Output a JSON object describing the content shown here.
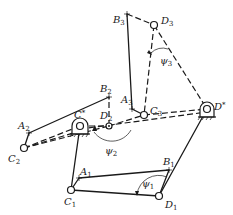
{
  "diagram": {
    "fixed_pivots": [
      {
        "id": "C*",
        "label": "C",
        "sup": "*"
      },
      {
        "id": "D*",
        "label": "D",
        "sup": "*"
      }
    ],
    "points": {
      "A1": {
        "label": "A",
        "sub": "1"
      },
      "B1": {
        "label": "B",
        "sub": "1"
      },
      "C1": {
        "label": "C",
        "sub": "1"
      },
      "D1": {
        "label": "D",
        "sub": "1"
      },
      "A2": {
        "label": "A",
        "sub": "2"
      },
      "B2": {
        "label": "B",
        "sub": "2"
      },
      "C2": {
        "label": "C",
        "sub": "2"
      },
      "D2": {
        "label": "D",
        "sub": "2"
      },
      "A3": {
        "label": "A",
        "sub": "3"
      },
      "B3": {
        "label": "B",
        "sub": "3"
      },
      "C3": {
        "label": "C",
        "sub": "3"
      },
      "D3": {
        "label": "D",
        "sub": "3"
      }
    },
    "angles": [
      {
        "id": "psi1",
        "label": "ψ",
        "sub": "1"
      },
      {
        "id": "psi2",
        "label": "ψ",
        "sub": "2"
      },
      {
        "id": "psi3",
        "label": "ψ",
        "sub": "3"
      }
    ],
    "colors": {
      "ink": "#1a1a1a",
      "background": "#ffffff"
    }
  }
}
